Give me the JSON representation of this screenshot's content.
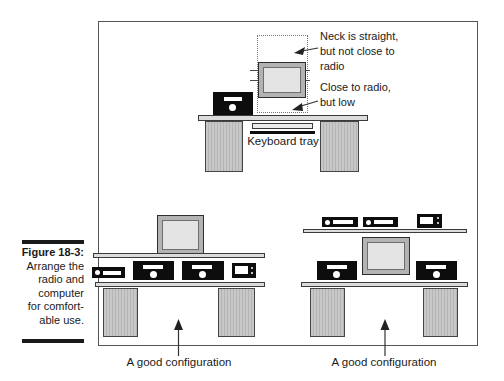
{
  "caption": {
    "title": "Figure 18-3:",
    "body": "Arrange the\nradio and\ncomputer\nfor comfort-\nable use."
  },
  "diagram": {
    "top_desk": {
      "annotation_high": "Neck is straight,\nbut not close to\nradio",
      "annotation_low": "Close to radio,\nbut low",
      "keyboard_tray_label": "Keyboard tray"
    },
    "bottom_left_desk": {
      "label": "A good configuration"
    },
    "bottom_right_desk": {
      "label": "A good configuration"
    }
  },
  "colors": {
    "ink": "#1a1a1a",
    "equipment_black": "#0d0d0d",
    "desk_fill": "#dcdcdc",
    "leg_fill": "#c8c8c8",
    "monitor_frame": "#b3b3b3",
    "screen_fill": "#e4e4e4"
  }
}
